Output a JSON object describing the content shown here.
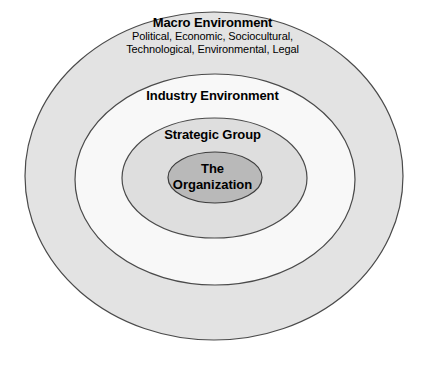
{
  "diagram": {
    "type": "concentric-ellipses",
    "background_color": "#ffffff",
    "layers": [
      {
        "id": "macro",
        "title": "Macro Environment",
        "subtitle_lines": [
          "Political, Economic, Sociocultural,",
          "Technological, Environmental, Legal"
        ],
        "fill_color": "#e3e3e3",
        "stroke_color": "#4a4a4a"
      },
      {
        "id": "industry",
        "title": "Industry Environment",
        "subtitle_lines": [],
        "fill_color": "#f8f8f8",
        "stroke_color": "#4a4a4a"
      },
      {
        "id": "strategic",
        "title": "Strategic Group",
        "subtitle_lines": [],
        "fill_color": "#dedede",
        "stroke_color": "#4a4a4a"
      },
      {
        "id": "organization",
        "title_lines": [
          "The",
          "Organization"
        ],
        "fill_color": "#b9b9b9",
        "stroke_color": "#3d3d3d"
      }
    ]
  }
}
